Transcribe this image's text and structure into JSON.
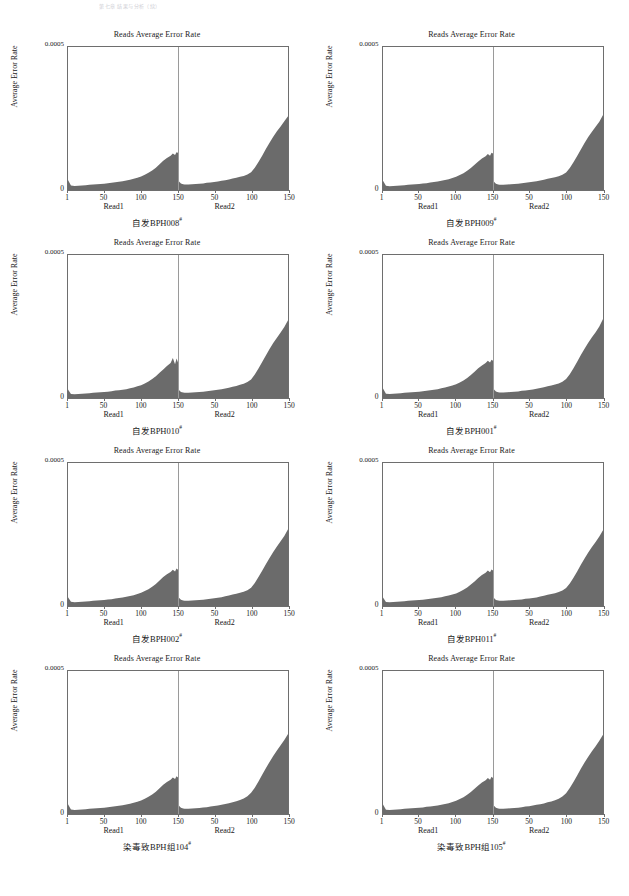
{
  "page": {
    "header_text": "第七章  结果与分析（续）",
    "width": 629,
    "height": 896
  },
  "axes": {
    "panel_title": "Reads Average Error Rate",
    "y_label": "Average Error Rate",
    "y_top_tick": "0.0005",
    "y_zero_tick": "0",
    "read1_label": "Read1",
    "read2_label": "Read2",
    "read1_ticks": [
      "1",
      "50",
      "100",
      "150"
    ],
    "read2_ticks": [
      "50",
      "100",
      "150"
    ]
  },
  "colors": {
    "fill": "#6b6b6b",
    "axis": "#6e6e6e",
    "midline": "#9a9a9a",
    "text": "#1a1a1a",
    "background": "#ffffff"
  },
  "panels": [
    {
      "id": "bph008",
      "caption": "自发BPH008",
      "caption_sup": "#"
    },
    {
      "id": "bph009",
      "caption": "自发BPH009",
      "caption_sup": "#"
    },
    {
      "id": "bph010",
      "caption": "自发BPH010",
      "caption_sup": "#"
    },
    {
      "id": "bph001",
      "caption": "自发BPH001",
      "caption_sup": "#"
    },
    {
      "id": "bph002",
      "caption": "自发BPH002",
      "caption_sup": "#"
    },
    {
      "id": "bph011",
      "caption": "自发BPH011",
      "caption_sup": "#"
    },
    {
      "id": "bph104",
      "caption": "染毒致BPH组104",
      "caption_sup": "#"
    },
    {
      "id": "bph105",
      "caption": "染毒致BPH组105",
      "caption_sup": "#"
    }
  ],
  "chart_data": {
    "type": "area",
    "title": "Reads Average Error Rate",
    "xlabel": "Position in read (Read1 | Read2)",
    "ylabel": "Average Error Rate",
    "ylim": [
      0,
      0.0005
    ],
    "xlim": [
      1,
      300
    ],
    "grid": false,
    "legend": null,
    "x_read1": [
      1,
      5,
      10,
      15,
      20,
      25,
      30,
      35,
      40,
      45,
      50,
      55,
      60,
      65,
      70,
      75,
      80,
      85,
      90,
      95,
      100,
      105,
      110,
      115,
      120,
      125,
      130,
      135,
      140,
      143,
      146,
      148,
      150
    ],
    "x_read2": [
      1,
      3,
      5,
      8,
      10,
      15,
      20,
      25,
      30,
      35,
      40,
      45,
      50,
      55,
      60,
      65,
      70,
      75,
      80,
      85,
      90,
      95,
      100,
      105,
      110,
      115,
      120,
      125,
      130,
      135,
      140,
      145,
      150
    ],
    "panel_series": [
      {
        "name": "自发BPH008",
        "read1": [
          3.5e-05,
          1.6e-05,
          1.4e-05,
          1.5e-05,
          1.6e-05,
          1.7e-05,
          1.8e-05,
          1.9e-05,
          2e-05,
          2.1e-05,
          2.2e-05,
          2.4e-05,
          2.5e-05,
          2.7e-05,
          2.9e-05,
          3.1e-05,
          3.3e-05,
          3.6e-05,
          3.9e-05,
          4.3e-05,
          4.7e-05,
          5.3e-05,
          6e-05,
          6.8e-05,
          7.8e-05,
          9e-05,
          0.000102,
          0.000112,
          0.00012,
          0.000128,
          0.000122,
          0.000132,
          0.00013
        ],
        "read2": [
          3.4e-05,
          2.8e-05,
          2.3e-05,
          2e-05,
          1.9e-05,
          1.9e-05,
          2e-05,
          2.1e-05,
          2.2e-05,
          2.3e-05,
          2.5e-05,
          2.6e-05,
          2.8e-05,
          3e-05,
          3.2e-05,
          3.4e-05,
          3.7e-05,
          4e-05,
          4.3e-05,
          4.6e-05,
          4.9e-05,
          5.4e-05,
          6.2e-05,
          7.8e-05,
          9.8e-05,
          0.00012,
          0.000143,
          0.000165,
          0.000186,
          0.000205,
          0.000222,
          0.00024,
          0.000258
        ]
      },
      {
        "name": "自发BPH009",
        "read1": [
          3.2e-05,
          1.5e-05,
          1.3e-05,
          1.4e-05,
          1.5e-05,
          1.6e-05,
          1.7e-05,
          1.8e-05,
          1.9e-05,
          2e-05,
          2.1e-05,
          2.3e-05,
          2.4e-05,
          2.6e-05,
          2.8e-05,
          3e-05,
          3.2e-05,
          3.5e-05,
          3.8e-05,
          4.2e-05,
          4.6e-05,
          5.2e-05,
          5.9e-05,
          6.7e-05,
          7.7e-05,
          8.8e-05,
          0.0001,
          0.00011,
          0.000118,
          0.000126,
          0.00012,
          0.00013,
          0.000128
        ],
        "read2": [
          3.3e-05,
          2.7e-05,
          2.2e-05,
          1.9e-05,
          1.8e-05,
          1.8e-05,
          1.9e-05,
          2e-05,
          2.1e-05,
          2.2e-05,
          2.4e-05,
          2.5e-05,
          2.7e-05,
          2.9e-05,
          3.1e-05,
          3.3e-05,
          3.6e-05,
          3.9e-05,
          4.2e-05,
          4.5e-05,
          4.8e-05,
          5.3e-05,
          6.1e-05,
          7.7e-05,
          9.7e-05,
          0.000119,
          0.000142,
          0.000164,
          0.000185,
          0.000204,
          0.000221,
          0.000239,
          0.000262
        ]
      },
      {
        "name": "自发BPH010",
        "read1": [
          3e-05,
          1.4e-05,
          1.3e-05,
          1.4e-05,
          1.5e-05,
          1.6e-05,
          1.7e-05,
          1.8e-05,
          1.9e-05,
          2e-05,
          2.1e-05,
          2.2e-05,
          2.4e-05,
          2.6e-05,
          2.7e-05,
          2.9e-05,
          3.1e-05,
          3.4e-05,
          3.7e-05,
          4.1e-05,
          4.5e-05,
          5.1e-05,
          5.8e-05,
          6.6e-05,
          7.6e-05,
          8.8e-05,
          0.0001,
          0.000112,
          0.000122,
          0.00014,
          0.000118,
          0.000138,
          0.000124
        ],
        "read2": [
          3.1e-05,
          2.6e-05,
          2.1e-05,
          1.9e-05,
          1.8e-05,
          1.8e-05,
          1.9e-05,
          2e-05,
          2.1e-05,
          2.2e-05,
          2.4e-05,
          2.5e-05,
          2.7e-05,
          2.9e-05,
          3.1e-05,
          3.3e-05,
          3.6e-05,
          3.9e-05,
          4.2e-05,
          4.6e-05,
          5e-05,
          5.6e-05,
          6.5e-05,
          8.2e-05,
          0.000103,
          0.000126,
          0.000149,
          0.000171,
          0.000192,
          0.000211,
          0.000229,
          0.000248,
          0.000272
        ]
      },
      {
        "name": "自发BPH001",
        "read1": [
          3.3e-05,
          1.5e-05,
          1.4e-05,
          1.5e-05,
          1.6e-05,
          1.7e-05,
          1.8e-05,
          1.9e-05,
          2e-05,
          2.1e-05,
          2.2e-05,
          2.4e-05,
          2.5e-05,
          2.7e-05,
          2.9e-05,
          3.1e-05,
          3.4e-05,
          3.7e-05,
          4e-05,
          4.4e-05,
          4.8e-05,
          5.4e-05,
          6.1e-05,
          7e-05,
          8e-05,
          9.2e-05,
          0.000104,
          0.000114,
          0.000122,
          0.00013,
          0.000124,
          0.000134,
          0.00013
        ],
        "read2": [
          3.4e-05,
          2.8e-05,
          2.3e-05,
          2e-05,
          1.9e-05,
          1.9e-05,
          2e-05,
          2.1e-05,
          2.2e-05,
          2.3e-05,
          2.5e-05,
          2.6e-05,
          2.8e-05,
          3e-05,
          3.2e-05,
          3.5e-05,
          3.8e-05,
          4.1e-05,
          4.4e-05,
          4.7e-05,
          5.1e-05,
          5.7e-05,
          6.6e-05,
          8.3e-05,
          0.000104,
          0.000127,
          0.00015,
          0.000172,
          0.000193,
          0.000212,
          0.00023,
          0.00025,
          0.000276
        ]
      },
      {
        "name": "自发BPH002",
        "read1": [
          3.1e-05,
          1.5e-05,
          1.3e-05,
          1.4e-05,
          1.5e-05,
          1.6e-05,
          1.7e-05,
          1.8e-05,
          1.9e-05,
          2e-05,
          2.1e-05,
          2.3e-05,
          2.4e-05,
          2.6e-05,
          2.8e-05,
          3e-05,
          3.2e-05,
          3.5e-05,
          3.8e-05,
          4.2e-05,
          4.6e-05,
          5.2e-05,
          5.9e-05,
          6.7e-05,
          7.7e-05,
          8.9e-05,
          0.000101,
          0.000111,
          0.000119,
          0.000127,
          0.000121,
          0.000131,
          0.000127
        ],
        "read2": [
          3.2e-05,
          2.7e-05,
          2.2e-05,
          1.9e-05,
          1.8e-05,
          1.8e-05,
          1.9e-05,
          2e-05,
          2.1e-05,
          2.2e-05,
          2.4e-05,
          2.5e-05,
          2.7e-05,
          2.9e-05,
          3.1e-05,
          3.4e-05,
          3.7e-05,
          4e-05,
          4.3e-05,
          4.6e-05,
          5e-05,
          5.5e-05,
          6.4e-05,
          8e-05,
          0.000101,
          0.000123,
          0.000146,
          0.000168,
          0.000189,
          0.000208,
          0.000226,
          0.000245,
          0.000268
        ]
      },
      {
        "name": "自发BPH011",
        "read1": [
          3e-05,
          1.4e-05,
          1.3e-05,
          1.4e-05,
          1.5e-05,
          1.6e-05,
          1.7e-05,
          1.8e-05,
          1.9e-05,
          2e-05,
          2.1e-05,
          2.2e-05,
          2.4e-05,
          2.5e-05,
          2.7e-05,
          2.9e-05,
          3.1e-05,
          3.4e-05,
          3.7e-05,
          4e-05,
          4.4e-05,
          5e-05,
          5.7e-05,
          6.5e-05,
          7.5e-05,
          8.6e-05,
          9.8e-05,
          0.000108,
          0.000116,
          0.000124,
          0.000118,
          0.000128,
          0.000124
        ],
        "read2": [
          3.1e-05,
          2.6e-05,
          2.1e-05,
          1.9e-05,
          1.8e-05,
          1.8e-05,
          1.9e-05,
          2e-05,
          2.1e-05,
          2.2e-05,
          2.3e-05,
          2.5e-05,
          2.6e-05,
          2.8e-05,
          3e-05,
          3.3e-05,
          3.6e-05,
          3.9e-05,
          4.2e-05,
          4.5e-05,
          4.9e-05,
          5.4e-05,
          6.3e-05,
          7.9e-05,
          9.9e-05,
          0.000121,
          0.000144,
          0.000166,
          0.000187,
          0.000206,
          0.000224,
          0.000243,
          0.000265
        ]
      },
      {
        "name": "染毒致BPH组104",
        "read1": [
          3.4e-05,
          1.6e-05,
          1.4e-05,
          1.5e-05,
          1.6e-05,
          1.7e-05,
          1.8e-05,
          1.9e-05,
          2e-05,
          2.1e-05,
          2.2e-05,
          2.4e-05,
          2.5e-05,
          2.7e-05,
          2.9e-05,
          3.1e-05,
          3.3e-05,
          3.6e-05,
          3.9e-05,
          4.3e-05,
          4.7e-05,
          5.3e-05,
          6e-05,
          6.8e-05,
          7.8e-05,
          9e-05,
          0.000102,
          0.000112,
          0.00012,
          0.000128,
          0.000122,
          0.000132,
          0.000128
        ],
        "read2": [
          3.3e-05,
          2.7e-05,
          2.2e-05,
          1.9e-05,
          1.8e-05,
          1.8e-05,
          1.9e-05,
          2e-05,
          2.1e-05,
          2.3e-05,
          2.4e-05,
          2.6e-05,
          2.8e-05,
          3e-05,
          3.2e-05,
          3.5e-05,
          3.8e-05,
          4.1e-05,
          4.5e-05,
          4.9e-05,
          5.4e-05,
          6.2e-05,
          7.4e-05,
          9.2e-05,
          0.000114,
          0.000137,
          0.00016,
          0.000182,
          0.000203,
          0.000222,
          0.00024,
          0.000259,
          0.00028
        ]
      },
      {
        "name": "染毒致BPH组105",
        "read1": [
          3.3e-05,
          1.5e-05,
          1.4e-05,
          1.5e-05,
          1.6e-05,
          1.7e-05,
          1.8e-05,
          1.9e-05,
          2e-05,
          2.1e-05,
          2.2e-05,
          2.3e-05,
          2.5e-05,
          2.6e-05,
          2.8e-05,
          3e-05,
          3.2e-05,
          3.5e-05,
          3.8e-05,
          4.2e-05,
          4.6e-05,
          5.2e-05,
          5.9e-05,
          6.7e-05,
          7.7e-05,
          8.8e-05,
          0.0001,
          0.00011,
          0.000118,
          0.000126,
          0.00012,
          0.00013,
          0.000126
        ],
        "read2": [
          3.2e-05,
          2.7e-05,
          2.2e-05,
          1.9e-05,
          1.8e-05,
          1.8e-05,
          1.9e-05,
          2e-05,
          2.1e-05,
          2.2e-05,
          2.4e-05,
          2.6e-05,
          2.7e-05,
          3e-05,
          3.2e-05,
          3.4e-05,
          3.7e-05,
          4.1e-05,
          4.4e-05,
          4.8e-05,
          5.3e-05,
          6.1e-05,
          7.3e-05,
          9.1e-05,
          0.000112,
          0.000135,
          0.000158,
          0.00018,
          0.0002,
          0.000219,
          0.000237,
          0.000256,
          0.000277
        ]
      }
    ]
  }
}
